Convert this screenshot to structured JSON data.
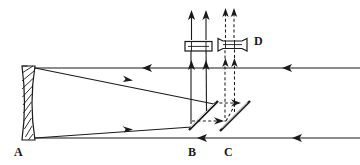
{
  "figure": {
    "background_color": "#ffffff",
    "stroke_color": "#1a1a1a",
    "width": 360,
    "height": 165
  },
  "labels": [
    {
      "id": "label-a",
      "text": "A",
      "x": 14,
      "y": 146,
      "refers_to": "concave-primary-mirror"
    },
    {
      "id": "label-b",
      "text": "B",
      "x": 188,
      "y": 146,
      "refers_to": "fold-mirror-b"
    },
    {
      "id": "label-c",
      "text": "C",
      "x": 224,
      "y": 146,
      "refers_to": "fold-mirror-c"
    },
    {
      "id": "label-d",
      "text": "D",
      "x": 254,
      "y": 35,
      "refers_to": "lens-assembly-d"
    }
  ],
  "components": {
    "primary_mirror": {
      "name": "concave-primary-mirror",
      "label": "A",
      "style": "hatched",
      "x": 22,
      "top_y": 66,
      "bottom_y": 140,
      "width": 13,
      "curvature": "concave"
    },
    "fold_mirror_b": {
      "name": "fold-mirror-b",
      "label": "B",
      "x1": 190,
      "y1": 129,
      "x2": 218,
      "y2": 101,
      "angle_deg": 45,
      "style": "solid-double-line"
    },
    "fold_mirror_c": {
      "name": "fold-mirror-c",
      "label": "C",
      "x1": 221,
      "y1": 130,
      "x2": 250,
      "y2": 101,
      "angle_deg": 45,
      "style": "solid-double-line"
    },
    "lens_b": {
      "name": "lens-assembly-b",
      "shape": "rectangular-barrel",
      "cx": 198,
      "cy": 47,
      "width": 26,
      "height": 9
    },
    "lens_d": {
      "name": "lens-assembly-d",
      "label": "D",
      "shape": "flared-spool-barrel",
      "cx": 231,
      "cy": 45,
      "width": 30,
      "height": 9
    }
  },
  "optical_axes": {
    "upper_axis": {
      "name": "upper-optical-axis",
      "y": 68,
      "x_start": 30,
      "x_end": 360,
      "arrow_x": 290,
      "arrow_dir": "left"
    },
    "lower_axis": {
      "name": "lower-optical-axis",
      "y": 138,
      "x_start": 30,
      "x_end": 360,
      "arrow_x": 300,
      "arrow_dir": "left"
    }
  },
  "rays": {
    "solid": [
      {
        "name": "ray-incoming-upper",
        "comment": "upper incoming beam travelling left toward mirror A",
        "arrow_x": 150,
        "arrow_y": 68,
        "dir": "left"
      },
      {
        "name": "ray-incoming-lower",
        "comment": "lower incoming beam travelling left toward mirror A",
        "arrow_x": 205,
        "arrow_y": 138,
        "dir": "left"
      },
      {
        "name": "ray-reflected-upper",
        "comment": "reflected from mirror A top, descending right to fold mirror B",
        "arrow_x": 125,
        "arrow_y": 78,
        "dir": "right-down"
      },
      {
        "name": "ray-reflected-lower",
        "comment": "reflected from mirror A bottom, ascending right to fold mirror B",
        "arrow_x": 124,
        "arrow_y": 127,
        "dir": "right-up"
      },
      {
        "name": "ray-vertical-left",
        "comment": "folded beam going up into lens B",
        "arrow_x": 191,
        "arrow_y": 14,
        "dir": "up"
      },
      {
        "name": "ray-vertical-right",
        "comment": "folded beam going up into lens B",
        "arrow_x": 206,
        "arrow_y": 14,
        "dir": "up"
      }
    ],
    "dashed": [
      {
        "name": "dashed-ray-upper",
        "comment": "alternate path from mirror B to mirror C",
        "arrow_x": 235,
        "arrow_y": 102,
        "dir": "right"
      },
      {
        "name": "dashed-ray-lower",
        "comment": "alternate path from mirror B to mirror C",
        "arrow_x": 218,
        "arrow_y": 120,
        "dir": "right"
      },
      {
        "name": "dashed-vertical-left",
        "comment": "dashed beam rising into lens D",
        "arrow_x": 225,
        "arrow_y": 12,
        "dir": "up"
      },
      {
        "name": "dashed-vertical-right",
        "comment": "dashed beam rising into lens D",
        "arrow_x": 234,
        "arrow_y": 12,
        "dir": "up"
      }
    ]
  }
}
